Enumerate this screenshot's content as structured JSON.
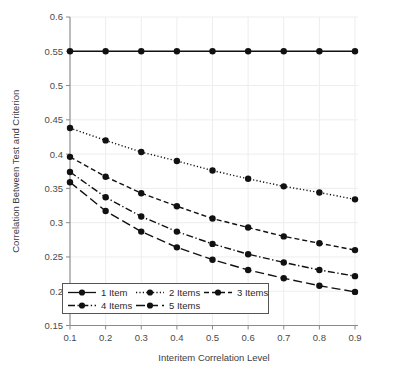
{
  "chart_data": {
    "type": "line",
    "title": "",
    "xlabel": "Interitem Correlation Level",
    "ylabel": "Correlation Between Test and Criterion",
    "x": [
      0.1,
      0.2,
      0.3,
      0.4,
      0.5,
      0.6,
      0.7,
      0.8,
      0.9
    ],
    "xtick_labels": [
      "0.1",
      "0.2",
      "0.3",
      "0.4",
      "0.5",
      "0.6",
      "0.7",
      "0.8",
      "0.9"
    ],
    "ytick_labels": [
      "0.15",
      "0.2",
      "0.25",
      "0.3",
      "0.35",
      "0.4",
      "0.45",
      "0.5",
      "0.55",
      "0.6"
    ],
    "yticks": [
      0.15,
      0.2,
      0.25,
      0.3,
      0.35,
      0.4,
      0.45,
      0.5,
      0.55,
      0.6
    ],
    "xlim": [
      0.1,
      0.9
    ],
    "ylim": [
      0.15,
      0.6
    ],
    "grid": true,
    "legend_position": "lower-left-inside",
    "series": [
      {
        "name": "1 Item",
        "style": "solid",
        "color": "#111111",
        "values": [
          0.55,
          0.55,
          0.55,
          0.55,
          0.55,
          0.55,
          0.55,
          0.55,
          0.55
        ]
      },
      {
        "name": "2 Items",
        "style": "dotted",
        "color": "#111111",
        "values": [
          0.438,
          0.42,
          0.403,
          0.39,
          0.376,
          0.364,
          0.353,
          0.344,
          0.334
        ]
      },
      {
        "name": "3 Items",
        "style": "dashed",
        "color": "#111111",
        "values": [
          0.396,
          0.367,
          0.343,
          0.324,
          0.306,
          0.293,
          0.28,
          0.27,
          0.26
        ]
      },
      {
        "name": "4 Items",
        "style": "dashdot",
        "color": "#111111",
        "values": [
          0.374,
          0.337,
          0.309,
          0.287,
          0.269,
          0.254,
          0.242,
          0.231,
          0.222
        ]
      },
      {
        "name": "5 Items",
        "style": "longdash",
        "color": "#111111",
        "values": [
          0.359,
          0.317,
          0.287,
          0.264,
          0.246,
          0.231,
          0.219,
          0.208,
          0.199
        ]
      }
    ]
  },
  "legend": {
    "entries": [
      "1 Item",
      "2 Items",
      "3 Items",
      "4 Items",
      "5 Items"
    ]
  }
}
